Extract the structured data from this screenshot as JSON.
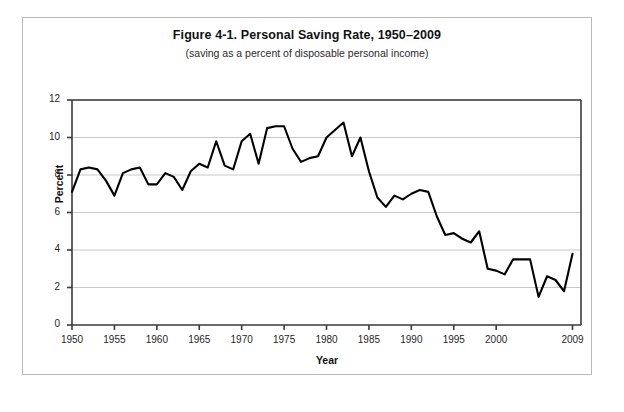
{
  "figure": {
    "title": "Figure 4-1. Personal Saving Rate, 1950–2009",
    "subtitle": "(saving as a percent of disposable personal income)"
  },
  "axes": {
    "ylabel": "Percent",
    "xlabel": "Year"
  },
  "chart_data": {
    "type": "line",
    "title": "Figure 4-1. Personal Saving Rate, 1950–2009",
    "subtitle": "(saving as a percent of disposable personal income)",
    "xlabel": "Year",
    "ylabel": "Percent",
    "xlim": [
      1950,
      2010
    ],
    "ylim": [
      0,
      12
    ],
    "ytick_values": [
      0,
      2,
      4,
      6,
      8,
      10,
      12
    ],
    "ytick_labels": [
      "0",
      "2",
      "4",
      "6",
      "8",
      "10",
      "12"
    ],
    "xtick_values": [
      1950,
      1955,
      1960,
      1965,
      1970,
      1975,
      1980,
      1985,
      1990,
      1995,
      2000,
      2009
    ],
    "xtick_labels": [
      "1950",
      "1955",
      "1960",
      "1965",
      "1970",
      "1975",
      "1980",
      "1985",
      "1990",
      "1995",
      "2000",
      "2009"
    ],
    "grid": "horizontal",
    "legend": "none",
    "line_color": "#000000",
    "grid_color": "#c8c8c8",
    "x": [
      1950,
      1951,
      1952,
      1953,
      1954,
      1955,
      1956,
      1957,
      1958,
      1959,
      1960,
      1961,
      1962,
      1963,
      1964,
      1965,
      1966,
      1967,
      1968,
      1969,
      1970,
      1971,
      1972,
      1973,
      1974,
      1975,
      1976,
      1977,
      1978,
      1979,
      1980,
      1981,
      1982,
      1983,
      1984,
      1985,
      1986,
      1987,
      1988,
      1989,
      1990,
      1991,
      1992,
      1993,
      1994,
      1995,
      1996,
      1997,
      1998,
      1999,
      2000,
      2001,
      2002,
      2003,
      2004,
      2005,
      2006,
      2007,
      2008,
      2009
    ],
    "values": [
      7.1,
      8.3,
      8.4,
      8.3,
      7.7,
      6.9,
      8.1,
      8.3,
      8.4,
      7.5,
      7.5,
      8.1,
      7.9,
      7.2,
      8.2,
      8.6,
      8.4,
      9.8,
      8.5,
      8.3,
      9.8,
      10.2,
      8.6,
      10.5,
      10.6,
      10.6,
      9.4,
      8.7,
      8.9,
      9.0,
      10.0,
      10.4,
      10.8,
      9.0,
      10.0,
      8.2,
      6.8,
      6.3,
      6.9,
      6.7,
      7.0,
      7.2,
      7.1,
      5.8,
      4.8,
      4.9,
      4.6,
      4.4,
      5.0,
      3.0,
      2.9,
      2.7,
      3.5,
      3.5,
      3.5,
      1.5,
      2.6,
      2.4,
      1.8,
      3.8
    ]
  }
}
